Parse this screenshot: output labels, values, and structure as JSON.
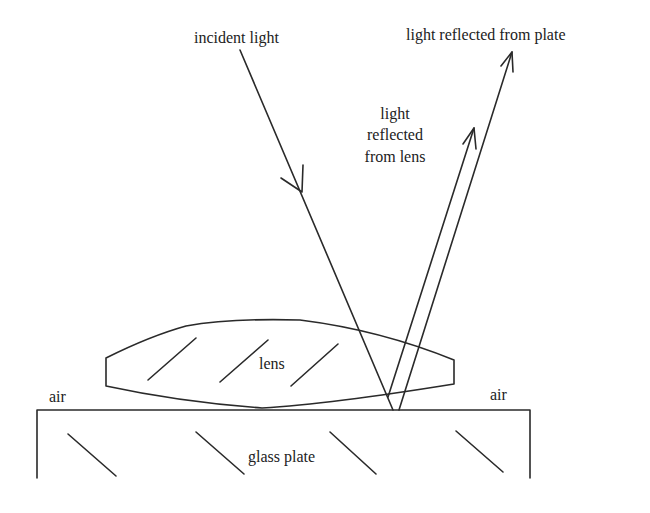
{
  "labels": {
    "incident": "incident light",
    "plate_reflected": "light reflected from plate",
    "lens_reflected_line1": "light",
    "lens_reflected_line2": "reflected",
    "lens_reflected_line3": "from lens",
    "lens": "lens",
    "air_left": "air",
    "air_right": "air",
    "glass_plate": "glass plate"
  },
  "colors": {
    "stroke": "#2a2a2a",
    "text": "#222222",
    "background": "#ffffff"
  }
}
